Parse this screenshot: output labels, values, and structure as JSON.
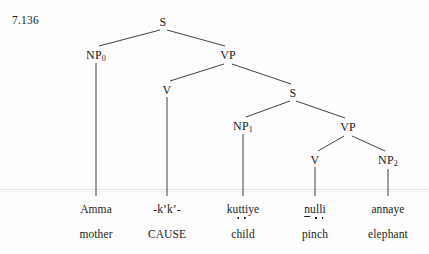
{
  "figure": {
    "example_number": "7.136",
    "language_note": "",
    "width": 429,
    "height": 254,
    "ink_color": "#1b1b1b",
    "background_color": "#fdfdfd"
  },
  "tree": {
    "nodes": [
      {
        "id": "s-root",
        "label": "S",
        "subscript": "",
        "x": 163,
        "y": 15
      },
      {
        "id": "np0",
        "label": "NP",
        "subscript": "0",
        "x": 96,
        "y": 48
      },
      {
        "id": "vp-outer",
        "label": "VP",
        "subscript": "",
        "x": 228,
        "y": 48
      },
      {
        "id": "v-cause",
        "label": "V",
        "subscript": "",
        "x": 167,
        "y": 83
      },
      {
        "id": "s-inner",
        "label": "S",
        "subscript": "",
        "x": 293,
        "y": 86
      },
      {
        "id": "np1",
        "label": "NP",
        "subscript": "1",
        "x": 243,
        "y": 119
      },
      {
        "id": "vp-inner",
        "label": "VP",
        "subscript": "",
        "x": 348,
        "y": 120
      },
      {
        "id": "v-pinch",
        "label": "V",
        "subscript": "",
        "x": 315,
        "y": 153
      },
      {
        "id": "np2",
        "label": "NP",
        "subscript": "2",
        "x": 388,
        "y": 153
      }
    ],
    "branches": [
      {
        "from": "s-root",
        "to": "np0",
        "x1": 160,
        "y1": 30,
        "x2": 99,
        "y2": 46
      },
      {
        "from": "s-root",
        "to": "vp-outer",
        "x1": 167,
        "y1": 30,
        "x2": 225,
        "y2": 46
      },
      {
        "from": "vp-outer",
        "to": "v-cause",
        "x1": 224,
        "y1": 64,
        "x2": 170,
        "y2": 81
      },
      {
        "from": "vp-outer",
        "to": "s-inner",
        "x1": 232,
        "y1": 64,
        "x2": 291,
        "y2": 84
      },
      {
        "from": "s-inner",
        "to": "np1",
        "x1": 290,
        "y1": 101,
        "x2": 246,
        "y2": 117
      },
      {
        "from": "s-inner",
        "to": "vp-inner",
        "x1": 296,
        "y1": 101,
        "x2": 345,
        "y2": 118
      },
      {
        "from": "vp-inner",
        "to": "v-pinch",
        "x1": 344,
        "y1": 136,
        "x2": 318,
        "y2": 151
      },
      {
        "from": "vp-inner",
        "to": "np2",
        "x1": 352,
        "y1": 136,
        "x2": 385,
        "y2": 151
      }
    ],
    "stems": [
      {
        "from": "np0",
        "x": 96,
        "y1": 63,
        "y2": 196
      },
      {
        "from": "v-cause",
        "x": 167,
        "y1": 97,
        "y2": 196
      },
      {
        "from": "np1",
        "x": 243,
        "y1": 134,
        "y2": 196
      },
      {
        "from": "v-pinch",
        "x": 315,
        "y1": 167,
        "y2": 196
      },
      {
        "from": "np2",
        "x": 388,
        "y1": 169,
        "y2": 196
      }
    ]
  },
  "terminals": [
    {
      "id": "amma",
      "x": 96,
      "y": 203,
      "word": "Amma",
      "gloss": "mother"
    },
    {
      "id": "kk",
      "x": 167,
      "y": 203,
      "word": "-k’k’-",
      "gloss": "CAUSE"
    },
    {
      "id": "kuttiye",
      "x": 243,
      "y": 203,
      "word": "kuttiye",
      "gloss": "child"
    },
    {
      "id": "nulli",
      "x": 315,
      "y": 203,
      "word": "nulli",
      "gloss": "pinch"
    },
    {
      "id": "annaye",
      "x": 388,
      "y": 203,
      "word": "annaye",
      "gloss": "elephant"
    }
  ],
  "gloss_row": {
    "y": 228,
    "items": [
      "mother",
      "CAUSE",
      "child",
      "pinch",
      "elephant"
    ]
  },
  "word_row": {
    "y": 203,
    "items": [
      "Amma",
      "-k’k’-",
      "kuttiye",
      "nulli",
      "annaye"
    ]
  },
  "transliteration_detail": {
    "kuttiye": {
      "before": "ku",
      "underdots": "tt",
      "after": "iye"
    },
    "nulli": {
      "underbar": "n",
      "mid": "u",
      "underdots": "ll",
      "after": "i"
    }
  }
}
